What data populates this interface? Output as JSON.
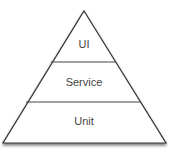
{
  "diagram": {
    "type": "pyramid",
    "colors": {
      "outline": "#333333",
      "fill": "#ffffff",
      "text": "#444444",
      "shadow": "#888888"
    },
    "layers": [
      {
        "label": "UI"
      },
      {
        "label": "Service"
      },
      {
        "label": "Unit"
      }
    ]
  }
}
